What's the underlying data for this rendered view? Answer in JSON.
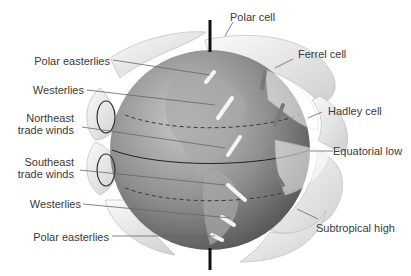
{
  "diagram": {
    "labels_left": [
      {
        "id": "polar-easterlies-north",
        "lines": [
          "Polar easterlies"
        ]
      },
      {
        "id": "westerlies-north",
        "lines": [
          "Westerlies"
        ]
      },
      {
        "id": "northeast-trade-winds",
        "lines": [
          "Northeast",
          "trade winds"
        ]
      },
      {
        "id": "southeast-trade-winds",
        "lines": [
          "Southeast",
          "trade winds"
        ]
      },
      {
        "id": "westerlies-south",
        "lines": [
          "Westerlies"
        ]
      },
      {
        "id": "polar-easterlies-south",
        "lines": [
          "Polar easterlies"
        ]
      }
    ],
    "labels_right": [
      {
        "id": "polar-cell",
        "lines": [
          "Polar cell"
        ]
      },
      {
        "id": "ferrel-cell",
        "lines": [
          "Ferrel cell"
        ]
      },
      {
        "id": "hadley-cell",
        "lines": [
          "Hadley cell"
        ]
      },
      {
        "id": "equatorial-low",
        "lines": [
          "Equatorial low"
        ]
      },
      {
        "id": "subtropical-high",
        "lines": [
          "Subtropical high"
        ]
      }
    ],
    "colors": {
      "globe": "#8a8a8a",
      "globe_light": "#bdbdbd",
      "cells": "#ececec",
      "axis": "#111111",
      "arrow": "#f2f2f2",
      "text": "#3a3a3a",
      "leader": "#555555"
    }
  }
}
